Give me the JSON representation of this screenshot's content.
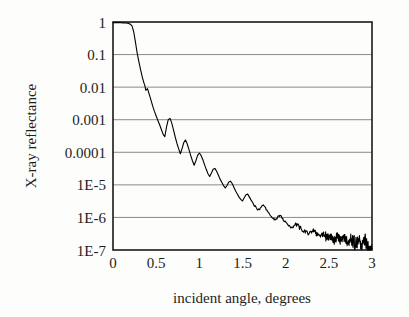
{
  "chart_data": {
    "type": "line",
    "title": "",
    "xlabel": "incident angle, degrees",
    "ylabel": "X-ray reflectance",
    "xlim": [
      0,
      3
    ],
    "ylim": [
      1e-07,
      1
    ],
    "yscale": "log",
    "xscale": "linear",
    "grid": "horizontal",
    "legend": "none",
    "xticks": [
      0,
      0.5,
      1,
      1.5,
      2,
      2.5,
      3
    ],
    "xtick_labels": [
      "0",
      "0.5",
      "1",
      "1.5",
      "2",
      "2.5",
      "3"
    ],
    "yticks": [
      1,
      0.1,
      0.01,
      0.001,
      0.0001,
      1e-05,
      1e-06,
      1e-07
    ],
    "ytick_labels": [
      "1",
      "0.1",
      "0.01",
      "0.001",
      "0.0001",
      "1E-5",
      "1E-6",
      "1E-7"
    ],
    "series": [
      {
        "name": "X-ray reflectance",
        "color": "#000000",
        "x": [
          0.0,
          0.03,
          0.06,
          0.09,
          0.12,
          0.15,
          0.18,
          0.2,
          0.22,
          0.24,
          0.26,
          0.28,
          0.3,
          0.32,
          0.34,
          0.36,
          0.37,
          0.38,
          0.4,
          0.42,
          0.44,
          0.46,
          0.48,
          0.5,
          0.52,
          0.54,
          0.56,
          0.58,
          0.6,
          0.62,
          0.64,
          0.66,
          0.68,
          0.7,
          0.72,
          0.74,
          0.76,
          0.78,
          0.8,
          0.82,
          0.84,
          0.86,
          0.88,
          0.9,
          0.92,
          0.94,
          0.96,
          0.98,
          1.0,
          1.02,
          1.04,
          1.06,
          1.08,
          1.1,
          1.12,
          1.14,
          1.16,
          1.18,
          1.2,
          1.22,
          1.24,
          1.26,
          1.28,
          1.3,
          1.32,
          1.34,
          1.36,
          1.38,
          1.4,
          1.42,
          1.44,
          1.46,
          1.48,
          1.5,
          1.52,
          1.54,
          1.56,
          1.58,
          1.6,
          1.62,
          1.64,
          1.66,
          1.68,
          1.7,
          1.72,
          1.74,
          1.76,
          1.78,
          1.8,
          1.82,
          1.84,
          1.86,
          1.88,
          1.9,
          1.92,
          1.94,
          1.96,
          1.98,
          2.0,
          2.02,
          2.04,
          2.06,
          2.08,
          2.1,
          2.12,
          2.14,
          2.16,
          2.18,
          2.2,
          2.22,
          2.24,
          2.26,
          2.28,
          2.3,
          2.32,
          2.34,
          2.36,
          2.38,
          2.4,
          2.42,
          2.44,
          2.46,
          2.48,
          2.5,
          2.52,
          2.54,
          2.56,
          2.58,
          2.6,
          2.62,
          2.64,
          2.66,
          2.68,
          2.7,
          2.72,
          2.74,
          2.76,
          2.78,
          2.8,
          2.82,
          2.84,
          2.86,
          2.88,
          2.9,
          2.92,
          2.94,
          2.96,
          2.98,
          3.0
        ],
        "y": [
          0.95,
          0.96,
          0.96,
          0.95,
          0.94,
          0.93,
          0.9,
          0.86,
          0.76,
          0.5,
          0.24,
          0.11,
          0.06,
          0.034,
          0.02,
          0.013,
          0.011,
          0.008,
          0.009,
          0.006,
          0.004,
          0.0026,
          0.0018,
          0.0013,
          0.00095,
          0.0007,
          0.0005,
          0.00036,
          0.0003,
          0.0006,
          0.001,
          0.0011,
          0.0008,
          0.0005,
          0.0003,
          0.00019,
          0.00013,
          9e-05,
          0.00013,
          0.0002,
          0.00024,
          0.00018,
          0.00012,
          8e-05,
          5.5e-05,
          4e-05,
          5.5e-05,
          8e-05,
          9.5e-05,
          8e-05,
          6e-05,
          4.2e-05,
          3e-05,
          2.2e-05,
          1.8e-05,
          2.3e-05,
          3e-05,
          3.2e-05,
          2.6e-05,
          2e-05,
          1.5e-05,
          1.2e-05,
          9.5e-06,
          8e-06,
          9.5e-06,
          1.2e-05,
          1.3e-05,
          1.1e-05,
          8.5e-06,
          6.5e-06,
          5.2e-06,
          4.2e-06,
          3.6e-06,
          3.2e-06,
          4e-06,
          5e-06,
          5.2e-06,
          4.2e-06,
          3.4e-06,
          2.8e-06,
          2.3e-06,
          2e-06,
          1.7e-06,
          1.8e-06,
          2.1e-06,
          2.3e-06,
          2e-06,
          1.7e-06,
          1.4e-06,
          1.2e-06,
          1e-06,
          9e-07,
          8.5e-07,
          9.5e-07,
          1.1e-06,
          1.1e-06,
          9.5e-07,
          8e-07,
          7e-07,
          6.2e-07,
          5.5e-07,
          5e-07,
          4.8e-07,
          5.4e-07,
          6e-07,
          5.8e-07,
          5e-07,
          4.4e-07,
          4e-07,
          3.6e-07,
          3.3e-07,
          3.2e-07,
          3.4e-07,
          3.8e-07,
          3.9e-07,
          3.5e-07,
          3.1e-07,
          2.8e-07,
          2.6e-07,
          2.9e-07,
          3.2e-07,
          2.7e-07,
          2.3e-07,
          2.6e-07,
          2.9e-07,
          2.4e-07,
          2e-07,
          2.3e-07,
          2.6e-07,
          2.2e-07,
          1.9e-07,
          2.2e-07,
          2.5e-07,
          2e-07,
          1.7e-07,
          2e-07,
          2.4e-07,
          1.9e-07,
          1.6e-07,
          1.8e-07,
          2.1e-07,
          1.7e-07,
          1.4e-07,
          1.6e-07,
          1.9e-07,
          1.5e-07,
          1.3e-07,
          1.5e-07,
          1.1e-07
        ]
      }
    ]
  },
  "style": {
    "background": "#fdfdfb",
    "frame_color": "#1a1a1a",
    "grid_color": "#8a8a8a",
    "line_color": "#000000"
  }
}
